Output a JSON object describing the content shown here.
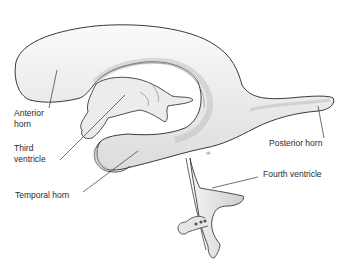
{
  "figure": {
    "labels": {
      "anterior_horn_line1": "Anterior",
      "anterior_horn_line2": "horn",
      "third_ventricle_line1": "Third",
      "third_ventricle_line2": "ventricle",
      "temporal_horn": "Temporal horn",
      "posterior_horn": "Posterior horn",
      "fourth_ventricle": "Fourth ventricle"
    },
    "colors": {
      "outline": "#3a3a3a",
      "fill": "#f2f2f2",
      "shade": "#c9c9c9",
      "leader": "#333333",
      "text": "#2a2a2a"
    }
  }
}
